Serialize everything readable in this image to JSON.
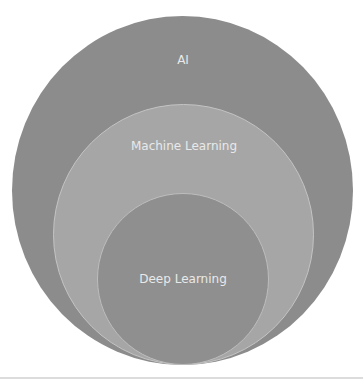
{
  "diagram": {
    "type": "nested-venn",
    "colors": {
      "outer": "#8c8c8c",
      "middle": "#a6a6a6",
      "inner": "#8f8f8f",
      "label_text": "#e9e9e9"
    },
    "sets": [
      {
        "id": "ai",
        "label": "AI"
      },
      {
        "id": "ml",
        "label": "Machine Learning",
        "contained_in": "ai"
      },
      {
        "id": "dl",
        "label": "Deep Learning",
        "contained_in": "ml"
      }
    ]
  }
}
